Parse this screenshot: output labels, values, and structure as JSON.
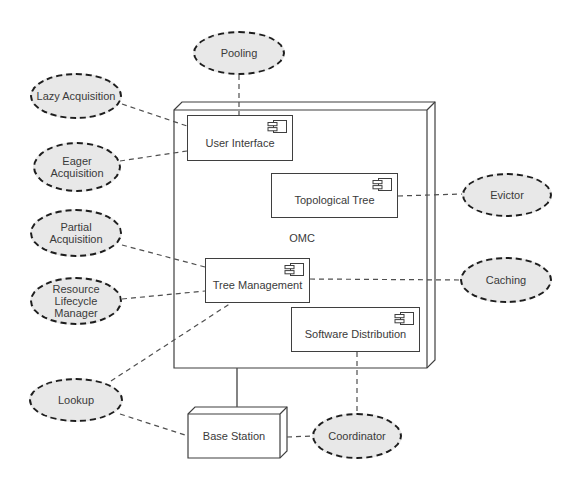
{
  "diagram": {
    "container": {
      "label": "OMC"
    },
    "components": [
      {
        "name": "user-interface",
        "label": "User Interface"
      },
      {
        "name": "topological-tree",
        "label": "Topological Tree"
      },
      {
        "name": "tree-management",
        "label": "Tree Management"
      },
      {
        "name": "software-distribution",
        "label": "Software Distribution"
      }
    ],
    "node": {
      "label": "Base Station"
    },
    "ellipses": [
      {
        "name": "pooling",
        "lines": [
          "Pooling"
        ]
      },
      {
        "name": "lazy-acquisition",
        "lines": [
          "Lazy Acquisition"
        ]
      },
      {
        "name": "eager-acquisition",
        "lines": [
          "Eager",
          "Acquisition"
        ]
      },
      {
        "name": "partial-acquisition",
        "lines": [
          "Partial",
          "Acquisition"
        ]
      },
      {
        "name": "resource-lifecycle-manager",
        "lines": [
          "Resource",
          "Lifecycle",
          "Manager"
        ]
      },
      {
        "name": "lookup",
        "lines": [
          "Lookup"
        ]
      },
      {
        "name": "evictor",
        "lines": [
          "Evictor"
        ]
      },
      {
        "name": "caching",
        "lines": [
          "Caching"
        ]
      },
      {
        "name": "coordinator",
        "lines": [
          "Coordinator"
        ]
      }
    ],
    "colors": {
      "background": "#ffffff",
      "ellipse_fill": "#e8e8e8",
      "ellipse_border": "#1d1d1d",
      "box_border": "#3f3f3f",
      "connector": "#4f4f4f",
      "text": "#3a3a3a"
    }
  }
}
